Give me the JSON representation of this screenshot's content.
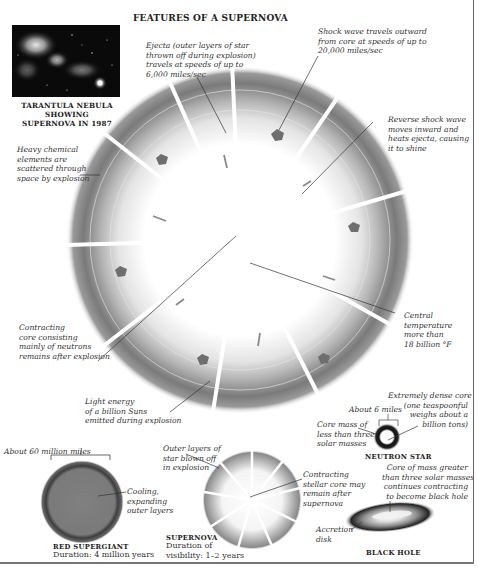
{
  "title": "FEATURES OF A SUPERNOVA",
  "photo": {
    "caption_line1": "TARANTULA NEBULA SHOWING",
    "caption_line2": "SUPERNOVA IN 1987"
  },
  "main_diagram": {
    "annotations": {
      "ejecta": "Ejecta (outer layers of star\nthrown off during explosion)\ntravels at speeds of up to\n6,000 miles/sec",
      "shock_wave": "Shock wave travels outward\nfrom core at speeds of up to\n20,000 miles/sec",
      "reverse_shock": "Reverse shock wave\nmoves inward and\nheats ejecta, causing\nit to shine",
      "heavy_elements": "Heavy chemical\nelements are\nscattered through\nspace by explosion",
      "central_temp": "Central\ntemperature\nmore than\n18 billion °F",
      "neutron_core": "Contracting\ncore consisting\nmainly of neutrons\nremains after explosion",
      "light_energy": "Light energy\nof a billion Suns\nemitted during explosion"
    }
  },
  "neutron_star": {
    "label": "NEUTRON STAR",
    "size": "About 6 miles",
    "core_mass": "Core mass of\nless than three\nsolar masses",
    "dense_core": "Extremely dense core\n(one teaspoonful\nweighs about a\nbillion tons)"
  },
  "black_hole": {
    "label": "BLACK HOLE",
    "core_mass": "Core of mass greater\nthan three solar masses\ncontinues contracting\nto become black hole",
    "accretion": "Accretion\ndisk"
  },
  "red_supergiant": {
    "size": "About 60 million miles",
    "note": "Cooling,\nexpanding\nouter layers",
    "label": "RED SUPERGIANT",
    "duration": "Duration: 4 million years"
  },
  "supernova_small": {
    "outer_layers": "Outer layers of\nstar blown off\nin explosion",
    "contracting_core": "Contracting\nstellar core may\nremain after\nsupernova",
    "label": "SUPERNOVA",
    "duration_line1": "Duration of",
    "duration_line2": "visibility: 1–2 years"
  },
  "colors": {
    "ring_dark": "#6e6e6e",
    "ring_light": "#d8d8d8",
    "arrow": "#7a7a7a",
    "red_supergiant": "#7d7d7d",
    "frame": "#666666"
  }
}
